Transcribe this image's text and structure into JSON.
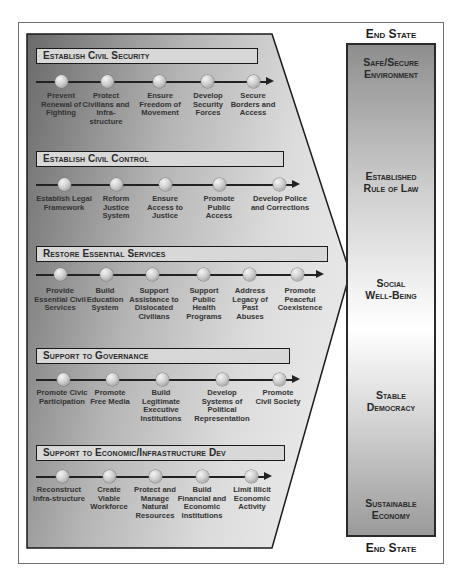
{
  "diagram": {
    "end_state_label_top": "End State",
    "end_state_label_bottom": "End State",
    "end_states": [
      {
        "line1": "Safe/Secure",
        "line2": "Environment"
      },
      {
        "line1": "Established",
        "line2": "Rule of Law"
      },
      {
        "line1": "Social",
        "line2": "Well-Being"
      },
      {
        "line1": "Stable",
        "line2": "Democracy"
      },
      {
        "line1": "Sustainable",
        "line2": "Economy"
      }
    ],
    "lanes": [
      {
        "title": "Establish Civil Security",
        "tasks": [
          "Prevent Renewal of Fighting",
          "Protect Civilians and Infra-structure",
          "Ensure Freedom of Movement",
          "Develop Security Forces",
          "Secure Borders and Access"
        ]
      },
      {
        "title": "Establish Civil Control",
        "tasks": [
          "Establish Legal Framework",
          "Reform Justice System",
          "Ensure Access to Justice",
          "Promote Public Access",
          "Develop Police and Corrections"
        ]
      },
      {
        "title": "Restore Essential Services",
        "tasks": [
          "Provide Essential Civil Services",
          "Build Education System",
          "Support Assistance to Dislocated Civilians",
          "Support Public Health Programs",
          "Address Legacy of Past Abuses",
          "Promote Peaceful Coexistence"
        ]
      },
      {
        "title": "Support to Governance",
        "tasks": [
          "Promote Civic Participation",
          "Promote Free Media",
          "Build Legitimate Executive Institutions",
          "Develop Systems of Political Representation",
          "Promote Civil Society"
        ]
      },
      {
        "title": "Support to Economic/Infrastructure Dev",
        "tasks": [
          "Reconstruct Infra-structure",
          "Create Viable Workforce",
          "Protect and Manage Natural Resources",
          "Build Financial and Economic Institutions",
          "Limit Illicit Economic Activity"
        ]
      }
    ],
    "colors": {
      "dark_gray": "#6f6f6f",
      "light_gray": "#d9d9d9",
      "outline": "#1a1a1a"
    }
  }
}
